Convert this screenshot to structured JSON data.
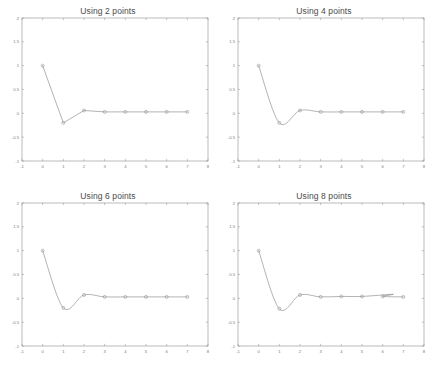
{
  "figure": {
    "background": "#ffffff",
    "line_color": "#8a8a8a",
    "axis_color": "#8e8e8e",
    "title_color": "#4a4a4a",
    "marker": "open-circle",
    "layout": "2x2"
  },
  "chart_data": [
    {
      "type": "line",
      "title": "Using 2 points",
      "xlabel": "",
      "ylabel": "",
      "xlim": [
        -1,
        8
      ],
      "ylim": [
        -1,
        2
      ],
      "xticks": [
        -1,
        0,
        1,
        2,
        3,
        4,
        5,
        6,
        7,
        8
      ],
      "xticklabels": [
        "-1",
        "0",
        "1",
        "2",
        "3",
        "4",
        "5",
        "6",
        "7",
        "8"
      ],
      "yticks": [
        -1,
        -0.5,
        0,
        0.5,
        1,
        1.5,
        2
      ],
      "yticklabels": [
        "-1",
        "-0.5",
        "0",
        "0.5",
        "1",
        "1.5",
        "2"
      ],
      "grid": false,
      "legend": null,
      "series": [
        {
          "name": "interpolant-2pt",
          "marker": "open-circle",
          "interpolation": "piecewise-linear",
          "x": [
            0,
            1,
            2,
            3,
            4,
            5,
            6,
            7
          ],
          "y": [
            1.0,
            -0.2,
            0.06,
            0.03,
            0.03,
            0.03,
            0.03,
            0.03
          ]
        }
      ]
    },
    {
      "type": "line",
      "title": "Using 4 points",
      "xlabel": "",
      "ylabel": "",
      "xlim": [
        -1,
        8
      ],
      "ylim": [
        -1,
        2
      ],
      "xticks": [
        -1,
        0,
        1,
        2,
        3,
        4,
        5,
        6,
        7,
        8
      ],
      "xticklabels": [
        "-1",
        "0",
        "1",
        "2",
        "3",
        "4",
        "5",
        "6",
        "7",
        "8"
      ],
      "yticks": [
        -1,
        -0.5,
        0,
        0.5,
        1,
        1.5,
        2
      ],
      "yticklabels": [
        "-1",
        "-0.5",
        "0",
        "0.5",
        "1",
        "1.5",
        "2"
      ],
      "grid": false,
      "legend": null,
      "series": [
        {
          "name": "interpolant-4pt",
          "marker": "open-circle",
          "interpolation": "smooth-spline",
          "x": [
            0,
            1,
            2,
            3,
            4,
            5,
            6,
            7
          ],
          "y": [
            1.0,
            -0.2,
            0.06,
            0.03,
            0.03,
            0.03,
            0.03,
            0.03
          ]
        }
      ]
    },
    {
      "type": "line",
      "title": "Using 6 points",
      "xlabel": "",
      "ylabel": "",
      "xlim": [
        -1,
        8
      ],
      "ylim": [
        -1,
        2
      ],
      "xticks": [
        -1,
        0,
        1,
        2,
        3,
        4,
        5,
        6,
        7,
        8
      ],
      "xticklabels": [
        "-1",
        "0",
        "1",
        "2",
        "3",
        "4",
        "5",
        "6",
        "7",
        "8"
      ],
      "yticks": [
        -1,
        -0.5,
        0,
        0.5,
        1,
        1.5,
        2
      ],
      "yticklabels": [
        "-1",
        "-0.5",
        "0",
        "0.5",
        "1",
        "1.5",
        "2"
      ],
      "grid": false,
      "legend": null,
      "series": [
        {
          "name": "interpolant-6pt",
          "marker": "open-circle",
          "interpolation": "smooth-spline",
          "x": [
            0,
            1,
            2,
            3,
            4,
            5,
            6,
            7
          ],
          "y": [
            1.0,
            -0.2,
            0.07,
            0.03,
            0.03,
            0.03,
            0.03,
            0.03
          ]
        }
      ]
    },
    {
      "type": "line",
      "title": "Using 8 points",
      "xlabel": "",
      "ylabel": "",
      "xlim": [
        -1,
        8
      ],
      "ylim": [
        -1,
        2
      ],
      "xticks": [
        -1,
        0,
        1,
        2,
        3,
        4,
        5,
        6,
        7,
        8
      ],
      "xticklabels": [
        "-1",
        "0",
        "1",
        "2",
        "3",
        "4",
        "5",
        "6",
        "7",
        "8"
      ],
      "yticks": [
        -1,
        -0.5,
        0,
        0.5,
        1,
        1.5,
        2
      ],
      "yticklabels": [
        "-1",
        "-0.5",
        "0",
        "0.5",
        "1",
        "1.5",
        "2"
      ],
      "grid": false,
      "legend": null,
      "series": [
        {
          "name": "interpolant-8pt",
          "marker": "open-circle",
          "interpolation": "smooth-spline-oscillating",
          "x": [
            0,
            1,
            2,
            3,
            4,
            5,
            6,
            7
          ],
          "y": [
            1.0,
            -0.22,
            0.07,
            0.03,
            0.04,
            0.04,
            0.04,
            0.03
          ]
        }
      ]
    }
  ]
}
